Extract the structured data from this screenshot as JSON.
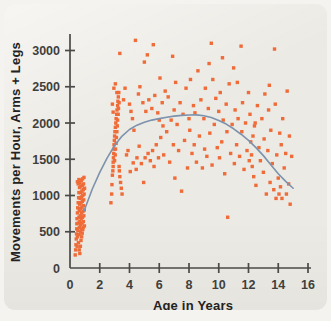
{
  "figure": {
    "panel_background": "#eceae4",
    "page_background": "#f4f3ef",
    "bleed_text": "tomorrow has the figure\nplace of the study be in\nresearch about 11 years\nchildren a specific that\nof the youngest group\n\n\nfor the children\nand little higher\ndouble the youth\ncompared from the\nthree bedroom with"
  },
  "chart_data": {
    "type": "scatter",
    "title": "",
    "subtitle": "",
    "xlabel": "Age in Years",
    "ylabel": "Movements per Hour, Arms + Legs",
    "xlim": [
      0,
      16
    ],
    "ylim": [
      0,
      3200
    ],
    "xticks": [
      0,
      2,
      4,
      6,
      8,
      10,
      12,
      14,
      16
    ],
    "yticks": [
      0,
      500,
      1000,
      1500,
      2000,
      2500,
      3000
    ],
    "xtick_labels": [
      "0",
      "2",
      "4",
      "6",
      "8",
      "10",
      "12",
      "14",
      "16"
    ],
    "ytick_labels": [
      "0",
      "500",
      "1000",
      "1500",
      "2000",
      "2500",
      "3000"
    ],
    "grid": false,
    "legend": "none",
    "marker": "square",
    "marker_size": 3.4,
    "point_color": "#ef6b38",
    "curve_color": "#7c92ad",
    "axis_color": "#4a4a48",
    "series": [
      {
        "name": "Children",
        "kind": "scatter",
        "points": [
          [
            0.35,
            180
          ],
          [
            0.38,
            250
          ],
          [
            0.4,
            320
          ],
          [
            0.42,
            400
          ],
          [
            0.44,
            470
          ],
          [
            0.45,
            540
          ],
          [
            0.46,
            610
          ],
          [
            0.47,
            680
          ],
          [
            0.48,
            300
          ],
          [
            0.5,
            760
          ],
          [
            0.5,
            430
          ],
          [
            0.52,
            830
          ],
          [
            0.53,
            520
          ],
          [
            0.55,
            900
          ],
          [
            0.56,
            620
          ],
          [
            0.57,
            350
          ],
          [
            0.58,
            970
          ],
          [
            0.6,
            1040
          ],
          [
            0.6,
            700
          ],
          [
            0.61,
            460
          ],
          [
            0.62,
            790
          ],
          [
            0.63,
            560
          ],
          [
            0.64,
            1110
          ],
          [
            0.65,
            880
          ],
          [
            0.66,
            640
          ],
          [
            0.67,
            1180
          ],
          [
            0.68,
            960
          ],
          [
            0.69,
            720
          ],
          [
            0.7,
            500
          ],
          [
            0.7,
            1040
          ],
          [
            0.71,
            820
          ],
          [
            0.72,
            600
          ],
          [
            0.73,
            1130
          ],
          [
            0.74,
            900
          ],
          [
            0.75,
            680
          ],
          [
            0.76,
            1210
          ],
          [
            0.77,
            980
          ],
          [
            0.78,
            760
          ],
          [
            0.79,
            540
          ],
          [
            0.8,
            1060
          ],
          [
            0.8,
            840
          ],
          [
            0.81,
            620
          ],
          [
            0.82,
            1140
          ],
          [
            0.83,
            920
          ],
          [
            0.84,
            700
          ],
          [
            0.85,
            1230
          ],
          [
            0.86,
            1000
          ],
          [
            0.87,
            780
          ],
          [
            0.88,
            560
          ],
          [
            0.89,
            1080
          ],
          [
            0.9,
            860
          ],
          [
            0.9,
            640
          ],
          [
            0.91,
            1160
          ],
          [
            0.92,
            940
          ],
          [
            0.93,
            720
          ],
          [
            0.94,
            1250
          ],
          [
            0.95,
            1020
          ],
          [
            0.96,
            800
          ],
          [
            0.97,
            580
          ],
          [
            0.98,
            1100
          ],
          [
            0.62,
            250
          ],
          [
            0.66,
            200
          ],
          [
            0.7,
            300
          ],
          [
            0.74,
            380
          ],
          [
            0.78,
            430
          ],
          [
            0.82,
            480
          ],
          [
            0.86,
            530
          ],
          [
            0.5,
            1190
          ],
          [
            0.55,
            1160
          ],
          [
            0.6,
            1220
          ],
          [
            2.75,
            900
          ],
          [
            2.8,
            1020
          ],
          [
            2.82,
            1150
          ],
          [
            2.85,
            1280
          ],
          [
            2.88,
            1340
          ],
          [
            2.9,
            1400
          ],
          [
            2.9,
            1460
          ],
          [
            2.92,
            1520
          ],
          [
            2.94,
            1580
          ],
          [
            2.95,
            1640
          ],
          [
            2.96,
            1700
          ],
          [
            2.98,
            1760
          ],
          [
            3.0,
            1820
          ],
          [
            3.0,
            1480
          ],
          [
            3.02,
            1880
          ],
          [
            3.04,
            1560
          ],
          [
            3.05,
            1940
          ],
          [
            3.06,
            1640
          ],
          [
            3.08,
            2000
          ],
          [
            3.1,
            1720
          ],
          [
            3.1,
            2060
          ],
          [
            3.12,
            1800
          ],
          [
            3.14,
            2120
          ],
          [
            3.15,
            1880
          ],
          [
            3.16,
            2180
          ],
          [
            3.18,
            1960
          ],
          [
            3.2,
            2240
          ],
          [
            3.2,
            2040
          ],
          [
            3.22,
            2300
          ],
          [
            3.24,
            2120
          ],
          [
            3.25,
            2360
          ],
          [
            3.26,
            2200
          ],
          [
            3.28,
            2420
          ],
          [
            3.3,
            2280
          ],
          [
            3.3,
            1400
          ],
          [
            3.32,
            1340
          ],
          [
            3.35,
            1260
          ],
          [
            3.4,
            1180
          ],
          [
            3.45,
            1100
          ],
          [
            3.5,
            1020
          ],
          [
            2.95,
            2480
          ],
          [
            3.05,
            2540
          ],
          [
            3.15,
            2420
          ],
          [
            2.85,
            2260
          ],
          [
            2.9,
            2150
          ],
          [
            3.35,
            2960
          ],
          [
            3.6,
            2320
          ],
          [
            3.7,
            2480
          ],
          [
            3.8,
            1560
          ],
          [
            3.9,
            1620
          ],
          [
            4.0,
            2260
          ],
          [
            4.05,
            1330
          ],
          [
            4.1,
            2160
          ],
          [
            4.2,
            2060
          ],
          [
            4.25,
            1450
          ],
          [
            4.3,
            1900
          ],
          [
            4.4,
            3140
          ],
          [
            4.45,
            1360
          ],
          [
            4.5,
            1520
          ],
          [
            4.6,
            2400
          ],
          [
            4.65,
            1680
          ],
          [
            4.7,
            2500
          ],
          [
            4.8,
            1440
          ],
          [
            4.9,
            2280
          ],
          [
            4.95,
            1180
          ],
          [
            5.0,
            2840
          ],
          [
            5.05,
            1520
          ],
          [
            5.1,
            2160
          ],
          [
            5.2,
            2940
          ],
          [
            5.25,
            1580
          ],
          [
            5.3,
            2320
          ],
          [
            5.4,
            1480
          ],
          [
            5.5,
            2200
          ],
          [
            5.55,
            1620
          ],
          [
            5.6,
            3080
          ],
          [
            5.65,
            1400
          ],
          [
            5.7,
            2380
          ],
          [
            5.8,
            1700
          ],
          [
            5.9,
            2140
          ],
          [
            5.95,
            1520
          ],
          [
            6.0,
            2040
          ],
          [
            6.05,
            2620
          ],
          [
            6.1,
            1800
          ],
          [
            6.2,
            2280
          ],
          [
            6.25,
            1960
          ],
          [
            6.3,
            1560
          ],
          [
            6.4,
            2440
          ],
          [
            6.5,
            1880
          ],
          [
            6.6,
            2360
          ],
          [
            6.7,
            1460
          ],
          [
            6.8,
            2040
          ],
          [
            6.9,
            2920
          ],
          [
            6.95,
            1700
          ],
          [
            7.0,
            2180
          ],
          [
            7.05,
            1240
          ],
          [
            7.1,
            2560
          ],
          [
            7.2,
            1980
          ],
          [
            7.3,
            1620
          ],
          [
            7.4,
            2280
          ],
          [
            7.5,
            1060
          ],
          [
            7.6,
            2120
          ],
          [
            7.7,
            1760
          ],
          [
            7.8,
            2480
          ],
          [
            7.9,
            1380
          ],
          [
            8.0,
            2060
          ],
          [
            8.05,
            1900
          ],
          [
            8.1,
            2600
          ],
          [
            8.2,
            1580
          ],
          [
            8.3,
            2240
          ],
          [
            8.35,
            1700
          ],
          [
            8.4,
            2140
          ],
          [
            8.5,
            1460
          ],
          [
            8.6,
            2720
          ],
          [
            8.7,
            1820
          ],
          [
            8.8,
            2320
          ],
          [
            8.9,
            1380
          ],
          [
            9.0,
            2060
          ],
          [
            9.05,
            1640
          ],
          [
            9.1,
            2480
          ],
          [
            9.2,
            1540
          ],
          [
            9.3,
            2200
          ],
          [
            9.4,
            1860
          ],
          [
            9.5,
            3100
          ],
          [
            9.55,
            1420
          ],
          [
            9.6,
            2600
          ],
          [
            9.7,
            1980
          ],
          [
            9.8,
            2340
          ],
          [
            9.9,
            1660
          ],
          [
            10.0,
            2160
          ],
          [
            10.05,
            1520
          ],
          [
            10.1,
            2420
          ],
          [
            10.2,
            1740
          ],
          [
            10.3,
            2040
          ],
          [
            10.4,
            1300
          ],
          [
            10.5,
            2260
          ],
          [
            10.55,
            1880
          ],
          [
            10.6,
            700
          ],
          [
            10.7,
            2540
          ],
          [
            10.8,
            1580
          ],
          [
            10.9,
            1980
          ],
          [
            11.0,
            2760
          ],
          [
            11.05,
            1440
          ],
          [
            11.1,
            2180
          ],
          [
            11.2,
            1700
          ],
          [
            11.3,
            2060
          ],
          [
            11.4,
            1540
          ],
          [
            11.5,
            3060
          ],
          [
            11.55,
            1880
          ],
          [
            11.6,
            2280
          ],
          [
            11.7,
            1360
          ],
          [
            11.8,
            2000
          ],
          [
            11.9,
            1620
          ],
          [
            12.0,
            2420
          ],
          [
            12.05,
            1480
          ],
          [
            12.1,
            2120
          ],
          [
            12.15,
            1740
          ],
          [
            12.2,
            1560
          ],
          [
            12.25,
            1400
          ],
          [
            12.3,
            1820
          ],
          [
            12.35,
            1260
          ],
          [
            12.4,
            1960
          ],
          [
            12.5,
            1140
          ],
          [
            12.6,
            2240
          ],
          [
            12.7,
            1660
          ],
          [
            12.8,
            1480
          ],
          [
            12.9,
            2060
          ],
          [
            13.0,
            1320
          ],
          [
            13.05,
            1780
          ],
          [
            13.1,
            2400
          ],
          [
            13.2,
            1020
          ],
          [
            13.3,
            1620
          ],
          [
            13.4,
            2520
          ],
          [
            13.45,
            1180
          ],
          [
            13.5,
            1900
          ],
          [
            13.6,
            1440
          ],
          [
            13.7,
            1080
          ],
          [
            13.8,
            2260
          ],
          [
            13.85,
            960
          ],
          [
            13.9,
            1560
          ],
          [
            14.0,
            1240
          ],
          [
            14.05,
            1020
          ],
          [
            14.1,
            1860
          ],
          [
            14.15,
            1120
          ],
          [
            14.2,
            1700
          ],
          [
            14.25,
            960
          ],
          [
            14.3,
            2060
          ],
          [
            14.4,
            1380
          ],
          [
            14.5,
            1580
          ],
          [
            14.55,
            1020
          ],
          [
            14.6,
            2440
          ],
          [
            14.7,
            1160
          ],
          [
            14.75,
            1820
          ],
          [
            14.8,
            880
          ],
          [
            14.9,
            1540
          ],
          [
            13.75,
            3020
          ],
          [
            13.35,
            2180
          ],
          [
            12.45,
            2000
          ],
          [
            11.25,
            2560
          ],
          [
            10.25,
            2900
          ],
          [
            9.35,
            2820
          ]
        ]
      },
      {
        "name": "Quadratic trend",
        "kind": "curve",
        "description": "Fitted quadratic rising from ~800 at age 1, peaking ~2100 near age 8.5, declining to ~1100 at age 15",
        "points": [
          [
            0.95,
            790
          ],
          [
            1.5,
            1090
          ],
          [
            2.0,
            1320
          ],
          [
            2.5,
            1520
          ],
          [
            3.0,
            1690
          ],
          [
            3.5,
            1820
          ],
          [
            4.0,
            1910
          ],
          [
            4.5,
            1970
          ],
          [
            5.0,
            2010
          ],
          [
            5.5,
            2040
          ],
          [
            6.0,
            2060
          ],
          [
            6.5,
            2080
          ],
          [
            7.0,
            2095
          ],
          [
            7.5,
            2105
          ],
          [
            8.0,
            2110
          ],
          [
            8.5,
            2112
          ],
          [
            9.0,
            2100
          ],
          [
            9.5,
            2075
          ],
          [
            10.0,
            2035
          ],
          [
            10.5,
            1985
          ],
          [
            11.0,
            1920
          ],
          [
            11.5,
            1845
          ],
          [
            12.0,
            1760
          ],
          [
            12.5,
            1660
          ],
          [
            13.0,
            1550
          ],
          [
            13.5,
            1425
          ],
          [
            14.0,
            1300
          ],
          [
            14.5,
            1195
          ],
          [
            15.0,
            1100
          ]
        ]
      }
    ]
  }
}
